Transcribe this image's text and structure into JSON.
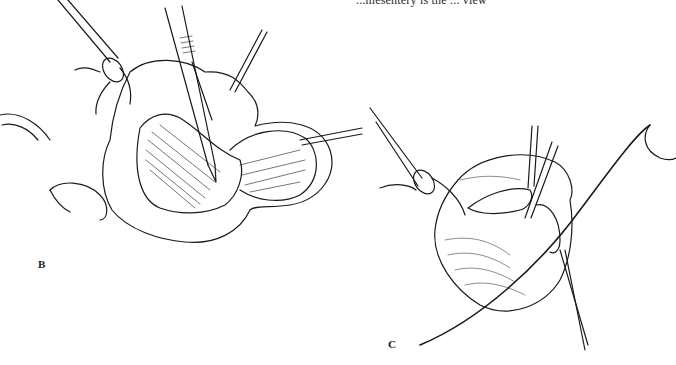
{
  "page": {
    "clipped_caption": "...mesentery is the ... view",
    "background": "#ffffff",
    "ink_color": "#1a1a1a"
  },
  "figures": [
    {
      "label": "B",
      "description": "Illustration of an opened organ with a clamp holding tissue at left, a scalpel incising at center, and a retractor hook at upper right and right"
    },
    {
      "label": "C",
      "description": "Illustration of an organ held by a clamp at left, a curved suture needle with thread crossing diagonally, and a probe/forceps at the incision on the right"
    }
  ]
}
